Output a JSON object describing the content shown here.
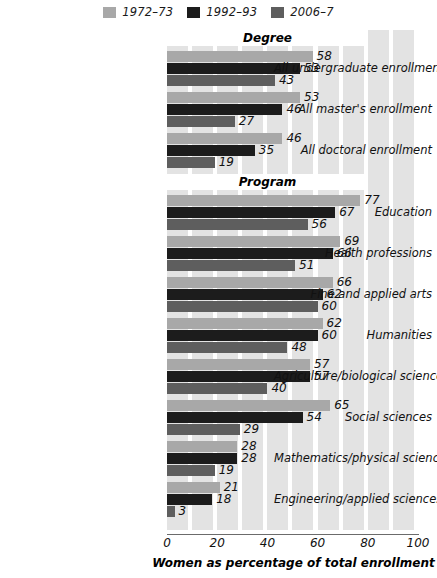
{
  "legend": {
    "entries": [
      {
        "label": "1972–73",
        "color": "#a8a8a8"
      },
      {
        "label": "1992–93",
        "color": "#1c1c1c"
      },
      {
        "label": "2006–7",
        "color": "#5e5e5e"
      }
    ]
  },
  "axis": {
    "title": "Women as percentage of total enrollment",
    "ticks": [
      "0",
      "20",
      "40",
      "60",
      "80",
      "100"
    ],
    "min": 0,
    "max": 100
  },
  "sections": [
    {
      "title": "Degree"
    },
    {
      "title": "Program"
    }
  ],
  "chart_data": {
    "type": "bar",
    "title": "",
    "xlabel": "Women as percentage of total enrollment",
    "ylabel": "",
    "xlim": [
      0,
      100
    ],
    "grid": true,
    "orientation": "horizontal",
    "legend_position": "top",
    "series": [
      {
        "name": "1972–73",
        "color": "#a8a8a8",
        "values": [
          58,
          53,
          46,
          77,
          69,
          66,
          62,
          57,
          65,
          28,
          21
        ]
      },
      {
        "name": "1992–93",
        "color": "#1c1c1c",
        "values": [
          53,
          46,
          35,
          67,
          66,
          62,
          60,
          57,
          54,
          28,
          18
        ]
      },
      {
        "name": "2006–7",
        "color": "#5e5e5e",
        "values": [
          43,
          27,
          19,
          56,
          51,
          60,
          48,
          40,
          29,
          19,
          3
        ]
      }
    ],
    "groups": [
      {
        "section": "Degree",
        "categories": [
          "All undergraduate enrollment",
          "All master's enrollment",
          "All doctoral enrollment"
        ],
        "rows": [
          {
            "label": "All undergraduate enrollment",
            "values": [
              58,
              53,
              43
            ]
          },
          {
            "label": "All master's enrollment",
            "values": [
              53,
              46,
              27
            ]
          },
          {
            "label": "All doctoral enrollment",
            "values": [
              46,
              35,
              19
            ]
          }
        ]
      },
      {
        "section": "Program",
        "categories": [
          "Education",
          "Health professions",
          "Fine and applied arts",
          "Humanities",
          "Agriculture/biological sciences",
          "Social sciences",
          "Mathematics/physical sciences",
          "Engineering/applied sciences"
        ],
        "rows": [
          {
            "label": "Education",
            "values": [
              77,
              67,
              56
            ]
          },
          {
            "label": "Health professions",
            "values": [
              69,
              66,
              51
            ]
          },
          {
            "label": "Fine and applied arts",
            "values": [
              66,
              62,
              60
            ]
          },
          {
            "label": "Humanities",
            "values": [
              62,
              60,
              48
            ]
          },
          {
            "label": "Agriculture/biological sciences",
            "values": [
              57,
              57,
              40
            ]
          },
          {
            "label": "Social sciences",
            "values": [
              65,
              54,
              29
            ]
          },
          {
            "label": "Mathematics/physical sciences",
            "values": [
              28,
              28,
              19
            ]
          },
          {
            "label": "Engineering/applied sciences",
            "values": [
              21,
              18,
              3
            ]
          }
        ]
      }
    ]
  }
}
